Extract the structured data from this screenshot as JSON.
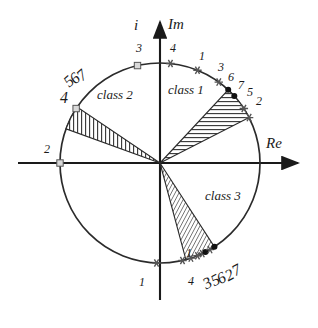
{
  "figure": {
    "axes": {
      "imag_axis_label": "i Im",
      "imag_symbol": "i",
      "imag_name": "Im",
      "real_axis_label": "Re"
    },
    "colors": {
      "stroke": "#1a1a1a",
      "circle": "#2b2b2b",
      "hatch": "#333333",
      "marker_fill": "#d9d9d9",
      "marker_edge": "#555555",
      "background": "#ffffff"
    },
    "geometry": {
      "origin_x": 160,
      "origin_y": 163,
      "radius": 100
    },
    "classes": [
      {
        "name": "class 1",
        "label_x": 168,
        "label_y": 83,
        "start_angle_deg": 27,
        "end_angle_deg": 47,
        "hatch": "horizontal"
      },
      {
        "name": "class 2",
        "label_x": 97,
        "label_y": 88,
        "start_angle_deg": 146,
        "end_angle_deg": 160,
        "hatch": "vertical"
      },
      {
        "name": "class 3",
        "label_x": 205,
        "label_y": 189,
        "start_angle_deg": -75,
        "end_angle_deg": -57,
        "hatch": "dense-diagonal"
      }
    ],
    "markers": [
      {
        "id": "m-top-3",
        "label": "3",
        "angle_deg": 103,
        "label_x": 136,
        "label_y": 42,
        "size": "pt",
        "rot": 0,
        "shape": "square"
      },
      {
        "id": "m-top-4",
        "label": "4",
        "angle_deg": 84,
        "label_x": 170,
        "label_y": 42,
        "size": "pt",
        "rot": 0,
        "shape": "star"
      },
      {
        "id": "m-c1-1",
        "label": "1",
        "angle_deg": 68,
        "label_x": 199,
        "label_y": 50,
        "size": "pt",
        "rot": 0,
        "shape": "star"
      },
      {
        "id": "m-c1-3",
        "label": "3",
        "angle_deg": 54,
        "label_x": 218,
        "label_y": 61,
        "size": "pt",
        "rot": 0,
        "shape": "star"
      },
      {
        "id": "m-c1-6",
        "label": "6",
        "angle_deg": 47,
        "label_x": 228,
        "label_y": 71,
        "size": "pt",
        "rot": 0,
        "shape": "dot"
      },
      {
        "id": "m-c1-7",
        "label": "7",
        "angle_deg": 42,
        "label_x": 238,
        "label_y": 79,
        "size": "pt",
        "rot": 0,
        "shape": "dot"
      },
      {
        "id": "m-c1-5",
        "label": "5",
        "angle_deg": 33,
        "label_x": 247,
        "label_y": 86,
        "size": "pt",
        "rot": 0,
        "shape": "star"
      },
      {
        "id": "m-c1-2",
        "label": "2",
        "angle_deg": 27,
        "label_x": 256,
        "label_y": 95,
        "size": "pt",
        "rot": 0,
        "shape": "star"
      },
      {
        "id": "m-c2-5",
        "label": "5",
        "angle_deg": 161,
        "label_x": 66,
        "label_y": 76,
        "size": "xs",
        "rot": -42,
        "shape": "none"
      },
      {
        "id": "m-c2-6",
        "label": "6",
        "angle_deg": 158,
        "label_x": 72,
        "label_y": 73,
        "size": "xs",
        "rot": -42,
        "shape": "none"
      },
      {
        "id": "m-c2-7",
        "label": "7",
        "angle_deg": 155,
        "label_x": 79,
        "label_y": 70,
        "size": "xs",
        "rot": -42,
        "shape": "none"
      },
      {
        "id": "m-c2-4",
        "label": "4",
        "angle_deg": 147,
        "label_x": 60,
        "label_y": 90,
        "size": "sm",
        "rot": 0,
        "shape": "square"
      },
      {
        "id": "m-left-2",
        "label": "2",
        "angle_deg": 180,
        "label_x": 44,
        "label_y": 143,
        "size": "pt",
        "rot": 0,
        "shape": "square"
      },
      {
        "id": "m-bot-1",
        "label": "1",
        "angle_deg": -92,
        "label_x": 139,
        "label_y": 276,
        "size": "pt",
        "rot": 0,
        "shape": "star"
      },
      {
        "id": "m-c3-1",
        "label": "1",
        "angle_deg": -72,
        "label_x": 186,
        "label_y": 247,
        "size": "pt",
        "rot": 0,
        "shape": "star"
      },
      {
        "id": "m-c3-4",
        "label": "4",
        "angle_deg": -77,
        "label_x": 188,
        "label_y": 275,
        "size": "pt",
        "rot": 0,
        "shape": "star"
      },
      {
        "id": "m-c3-3",
        "label": "3",
        "angle_deg": -68,
        "label_x": 204,
        "label_y": 277,
        "size": "xs",
        "rot": -28,
        "shape": "star"
      },
      {
        "id": "m-c3-5",
        "label": "5",
        "angle_deg": -65,
        "label_x": 212,
        "label_y": 274,
        "size": "xs",
        "rot": -28,
        "shape": "star"
      },
      {
        "id": "m-c3-6",
        "label": "6",
        "angle_deg": -63,
        "label_x": 218,
        "label_y": 272,
        "size": "xs",
        "rot": -28,
        "shape": "dot"
      },
      {
        "id": "m-c3-2",
        "label": "2",
        "angle_deg": -60,
        "label_x": 226,
        "label_y": 269,
        "size": "xs",
        "rot": -28,
        "shape": "star"
      },
      {
        "id": "m-c3-7",
        "label": "7",
        "angle_deg": -57,
        "label_x": 233,
        "label_y": 264,
        "size": "xs",
        "rot": -28,
        "shape": "dot"
      }
    ]
  }
}
